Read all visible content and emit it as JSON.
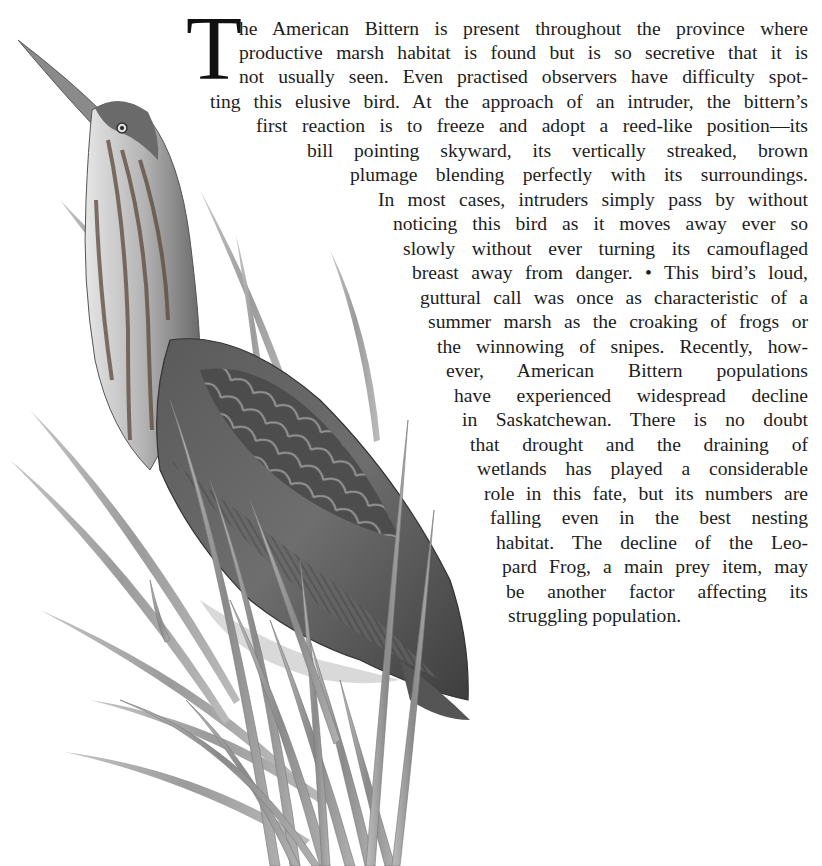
{
  "article": {
    "drop_cap": "T",
    "lines": [
      {
        "text": "he American Bittern is present throughout the province where",
        "left": 239,
        "top": 17
      },
      {
        "text": "productive marsh habitat is found but is so secretive that it is",
        "left": 239,
        "top": 41
      },
      {
        "text": "not usually seen. Even practised observers have difficulty spot-",
        "left": 239,
        "top": 65
      },
      {
        "text": "ting this elusive bird. At the approach of an intruder, the bittern’s",
        "left": 210,
        "top": 90
      },
      {
        "text": "first reaction is to freeze and adopt a reed-like position—its",
        "left": 256,
        "top": 114
      },
      {
        "text": "bill pointing skyward, its vertically streaked, brown",
        "left": 307,
        "top": 139
      },
      {
        "text": "plumage blending perfectly with its surroundings.",
        "left": 350,
        "top": 163
      },
      {
        "text": "In most cases, intruders simply pass by without",
        "left": 378,
        "top": 188
      },
      {
        "text": "noticing this bird as it moves away ever so",
        "left": 393,
        "top": 212
      },
      {
        "text": "slowly without ever turning its camouflaged",
        "left": 403,
        "top": 237
      },
      {
        "text": "breast away from danger. • This bird’s loud,",
        "left": 412,
        "top": 261
      },
      {
        "text": "guttural call was once as characteristic of a",
        "left": 420,
        "top": 286
      },
      {
        "text": "summer marsh as the croaking of frogs or",
        "left": 428,
        "top": 310
      },
      {
        "text": "the winnowing of snipes. Recently, how-",
        "left": 437,
        "top": 335
      },
      {
        "text": "ever, American Bittern populations",
        "left": 446,
        "top": 359
      },
      {
        "text": "have experienced widespread decline",
        "left": 454,
        "top": 384
      },
      {
        "text": "in Saskatchewan. There is no doubt",
        "left": 462,
        "top": 408
      },
      {
        "text": "that drought and the draining of",
        "left": 470,
        "top": 433
      },
      {
        "text": "wetlands has played a considerable",
        "left": 477,
        "top": 457
      },
      {
        "text": "role in this fate, but its numbers are",
        "left": 484,
        "top": 482
      },
      {
        "text": "falling even in the best nesting",
        "left": 490,
        "top": 506
      },
      {
        "text": "habitat. The decline of the Leo-",
        "left": 496,
        "top": 531
      },
      {
        "text": "pard Frog, a main prey item, may",
        "left": 502,
        "top": 555
      },
      {
        "text": "be another factor affecting its",
        "left": 506,
        "top": 580
      },
      {
        "text": "struggling population.",
        "left": 508,
        "top": 604,
        "last": true
      }
    ]
  },
  "illustration": {
    "subject": "American Bittern among marsh reeds",
    "style": "grayscale painting",
    "colors": {
      "dark": "#3a3a3a",
      "mid": "#7a7a7a",
      "light": "#c8c8c8",
      "reed": "#9a9a9a"
    }
  }
}
